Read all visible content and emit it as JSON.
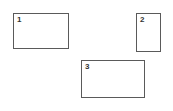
{
  "boxes": [
    {
      "label": "1",
      "x": 13,
      "y": 13,
      "w": 56,
      "h": 36
    },
    {
      "label": "2",
      "x": 136,
      "y": 13,
      "w": 25,
      "h": 39
    },
    {
      "label": "3",
      "x": 81,
      "y": 60,
      "w": 64,
      "h": 38
    }
  ],
  "colors": {
    "border": "#5a5a5a",
    "background": "#ffffff",
    "label": "#333333"
  }
}
